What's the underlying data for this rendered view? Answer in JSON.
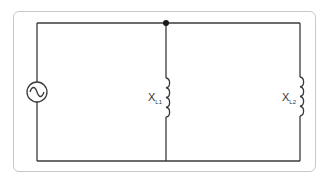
{
  "diagram": {
    "type": "parallel-ac-inductor-circuit",
    "source": {
      "kind": "ac-voltage-source",
      "symbol": "sine-wave"
    },
    "components": [
      {
        "id": "L1",
        "kind": "inductor",
        "label_main": "X",
        "label_sub": "L1"
      },
      {
        "id": "L2",
        "kind": "inductor",
        "label_main": "X",
        "label_sub": "L2"
      }
    ],
    "junctions": [
      {
        "position": "top-middle"
      }
    ],
    "colors": {
      "wire": "#3a3a3a",
      "frame": "#c8c8c8",
      "background": "#ffffff"
    }
  }
}
